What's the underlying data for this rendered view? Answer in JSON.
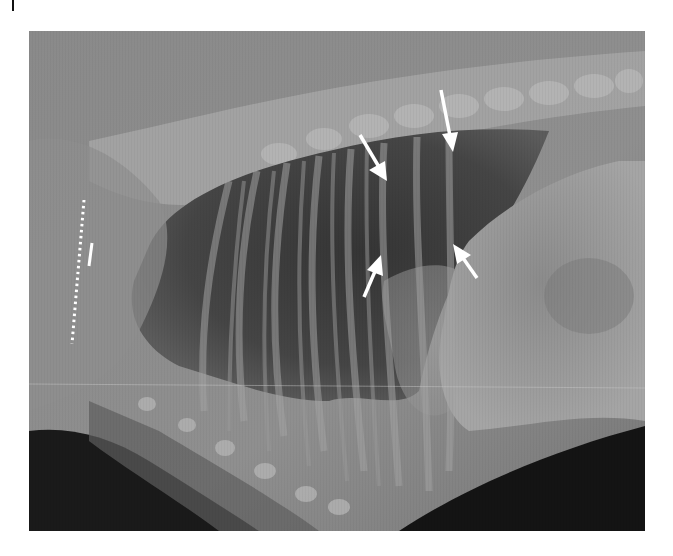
{
  "figure": {
    "type": "lateral thoracic radiograph",
    "annotations": {
      "arrows": [
        {
          "name": "arrow-upper-left",
          "direction": "down-right",
          "from": [
            360,
            135
          ],
          "to": [
            385,
            178
          ],
          "color": "#ffffff"
        },
        {
          "name": "arrow-upper-right",
          "direction": "down",
          "from": [
            441,
            90
          ],
          "to": [
            452,
            150
          ],
          "color": "#ffffff"
        },
        {
          "name": "arrow-lower-left",
          "direction": "up-right",
          "from": [
            365,
            297
          ],
          "to": [
            381,
            258
          ],
          "color": "#ffffff"
        },
        {
          "name": "arrow-lower-right",
          "direction": "up-left",
          "from": [
            477,
            277
          ],
          "to": [
            456,
            245
          ],
          "color": "#ffffff"
        }
      ],
      "dotted_line": {
        "from": [
          84,
          200
        ],
        "to": [
          72,
          344
        ],
        "color": "#ffffff"
      },
      "short_bar": {
        "from": [
          92,
          243
        ],
        "to": [
          89,
          266
        ],
        "color": "#ffffff"
      }
    },
    "colors": {
      "background": "#ffffff",
      "soft_tissue": "#8a8a8a",
      "lung_field": "#3e3e3e",
      "bone": "#b8b8b8",
      "air_outside": "#151515"
    }
  }
}
